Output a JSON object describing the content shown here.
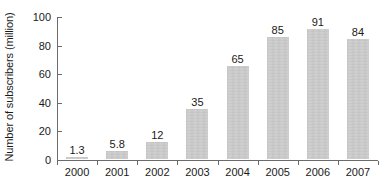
{
  "chart_data": {
    "type": "bar",
    "title": "",
    "subtitle": "",
    "xlabel": "",
    "ylabel": "Number of subscribers (million)",
    "categories": [
      "2000",
      "2001",
      "2002",
      "2003",
      "2004",
      "2005",
      "2006",
      "2007"
    ],
    "values": [
      1.3,
      5.8,
      12,
      35,
      65,
      85,
      91,
      84
    ],
    "value_labels": [
      "1.3",
      "5.8",
      "12",
      "35",
      "65",
      "85",
      "91",
      "84"
    ],
    "ylim": [
      0,
      100
    ],
    "yticks": [
      0,
      20,
      40,
      60,
      80,
      100
    ],
    "ytick_labels": [
      "0",
      "20",
      "40",
      "60",
      "80",
      "100"
    ],
    "grid": false,
    "legend": null,
    "legend_position": "none",
    "bar_color": "#c9c9c9",
    "axis_color": "#6b6b6b",
    "text_color": "#1a1a1a",
    "background_color": "#ffffff",
    "annotations": []
  }
}
